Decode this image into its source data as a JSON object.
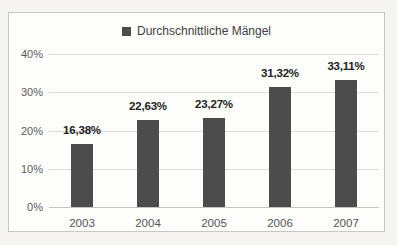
{
  "chart_data": {
    "type": "bar",
    "categories": [
      "2003",
      "2004",
      "2005",
      "2006",
      "2007"
    ],
    "values": [
      16.38,
      22.63,
      23.27,
      31.32,
      33.11
    ],
    "value_labels": [
      "16,38%",
      "22,63%",
      "23,27%",
      "31,32%",
      "33,11%"
    ],
    "series_name": "Durchschnittliche Mängel",
    "title": "",
    "xlabel": "",
    "ylabel": "",
    "ylim": [
      0,
      40
    ],
    "yticks": [
      0,
      10,
      20,
      30,
      40
    ],
    "ytick_labels": [
      "0%",
      "10%",
      "20%",
      "30%",
      "40%"
    ],
    "grid": true,
    "legend_position": "top-center",
    "bar_color": "#4c4c4c",
    "gridline_color": "#dcdcda",
    "axis_line_color": "#c5c5c2"
  }
}
